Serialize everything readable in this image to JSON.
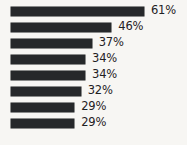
{
  "chart_data": {
    "type": "bar",
    "orientation": "horizontal",
    "title": "",
    "subtitle": "",
    "xlabel": "",
    "ylabel": "",
    "categories": [
      "",
      "",
      "",
      "",
      "",
      "",
      "",
      ""
    ],
    "values": [
      61,
      46,
      37,
      34,
      34,
      32,
      29,
      29
    ],
    "value_labels": [
      "61%",
      "46%",
      "37%",
      "34%",
      "34%",
      "32%",
      "29%",
      "29%"
    ],
    "unit": "%",
    "xlim": [
      0,
      61
    ],
    "grid": false,
    "legend": null,
    "legend_position": "none",
    "annotations": [],
    "axis_ticks_visible": false,
    "series": [
      {
        "name": "",
        "values": [
          61,
          46,
          37,
          34,
          34,
          32,
          29,
          29
        ]
      }
    ]
  },
  "style": {
    "bar_color": "#26282a",
    "background_color": "#f7f6f3",
    "label_color": "#1f2123"
  },
  "scale": {
    "px_per_unit": 2.18,
    "bar_origin_x": 11,
    "row_height": 16,
    "first_row_top": 3
  }
}
